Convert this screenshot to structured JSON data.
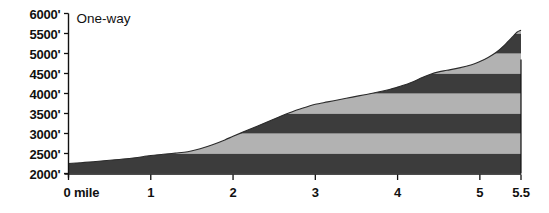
{
  "chart_data": {
    "type": "area",
    "title": "",
    "annotation": "One-way",
    "xlabel": "",
    "ylabel": "",
    "xlim": [
      0,
      5.5
    ],
    "ylim": [
      2000,
      6000
    ],
    "grid": false,
    "legend_position": "none",
    "x_unit_label": "0 mile",
    "x_ticks": [
      0,
      1,
      2,
      3,
      4,
      5,
      5.5
    ],
    "x_tick_labels": [
      "0 mile",
      "1",
      "2",
      "3",
      "4",
      "5",
      "5.5"
    ],
    "y_ticks": [
      2000,
      2500,
      3000,
      3500,
      4000,
      4500,
      5000,
      5500,
      6000
    ],
    "y_tick_labels": [
      "2000'",
      "2500'",
      "3000'",
      "3500'",
      "4000'",
      "4500'",
      "5000'",
      "5500'",
      "6000'"
    ],
    "band_interval": 500,
    "band_colors": {
      "dark": "#3c3c3c",
      "light": "#b2b2b2"
    },
    "bands": [
      {
        "from": 2000,
        "to": 2500,
        "shade": "dark"
      },
      {
        "from": 2500,
        "to": 3000,
        "shade": "light"
      },
      {
        "from": 3000,
        "to": 3500,
        "shade": "dark"
      },
      {
        "from": 3500,
        "to": 4000,
        "shade": "light"
      },
      {
        "from": 4000,
        "to": 4500,
        "shade": "dark"
      },
      {
        "from": 4500,
        "to": 5000,
        "shade": "light"
      },
      {
        "from": 5000,
        "to": 5500,
        "shade": "dark"
      },
      {
        "from": 5500,
        "to": 6000,
        "shade": "light"
      }
    ],
    "x": [
      0,
      0.15,
      0.3,
      0.5,
      0.7,
      0.9,
      1.0,
      1.15,
      1.3,
      1.45,
      1.6,
      1.75,
      1.9,
      2.0,
      2.15,
      2.3,
      2.45,
      2.6,
      2.75,
      2.9,
      3.0,
      3.15,
      3.3,
      3.45,
      3.6,
      3.75,
      3.9,
      4.0,
      4.15,
      4.3,
      4.4,
      4.5,
      4.6,
      4.75,
      4.9,
      5.0,
      5.1,
      5.2,
      5.3,
      5.4,
      5.45,
      5.5
    ],
    "values": [
      2250,
      2270,
      2295,
      2330,
      2370,
      2420,
      2450,
      2480,
      2510,
      2545,
      2620,
      2720,
      2840,
      2930,
      3060,
      3190,
      3320,
      3450,
      3570,
      3670,
      3730,
      3790,
      3850,
      3910,
      3970,
      4030,
      4100,
      4160,
      4260,
      4400,
      4480,
      4540,
      4580,
      4640,
      4720,
      4800,
      4900,
      5030,
      5210,
      5420,
      5530,
      5580
    ],
    "axis_color": "#111111"
  }
}
